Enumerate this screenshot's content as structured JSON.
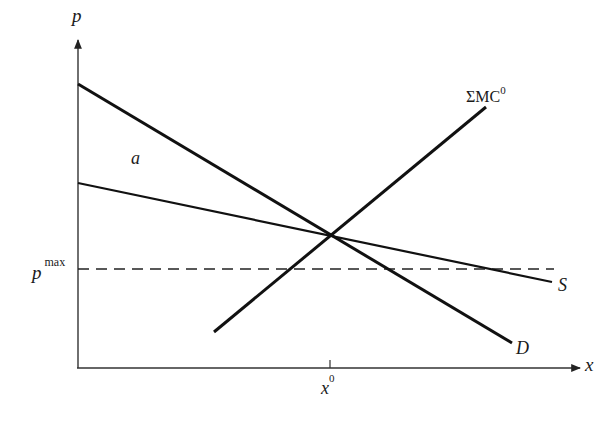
{
  "diagram": {
    "axes": {
      "y_label": "p",
      "x_label": "x"
    },
    "curves": {
      "demand": {
        "label": "D"
      },
      "supply": {
        "label": "S"
      },
      "marginal_cost": {
        "label_base": "ΣMC",
        "label_sup": "0"
      }
    },
    "price_ceiling": {
      "label_base": "p",
      "label_sup": "max"
    },
    "equilibrium_quantity": {
      "label_base": "x",
      "label_sup": "0"
    },
    "region_label": "a",
    "colors": {
      "line": "#111111",
      "background": "#ffffff"
    }
  }
}
